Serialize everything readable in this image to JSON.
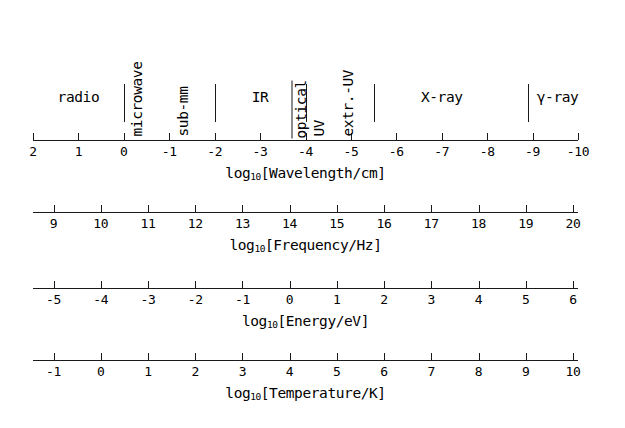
{
  "figure": {
    "background_color": "#ffffff",
    "ink_color": "#1a1a1a"
  },
  "chart_data": {
    "type": "table",
    "title": "",
    "axes": [
      {
        "name": "wavelength",
        "label": "log",
        "label_sub": "10",
        "label_rest": "[Wavelength/cm]",
        "label_full": "log10[Wavelength/cm]",
        "direction": "decreasing",
        "ticks": [
          "2",
          "1",
          "0",
          "-1",
          "-2",
          "-3",
          "-4",
          "-5",
          "-6",
          "-7",
          "-8",
          "-9",
          "-10"
        ],
        "tick_values": [
          2,
          1,
          0,
          -1,
          -2,
          -3,
          -4,
          -5,
          -6,
          -7,
          -8,
          -9,
          -10
        ],
        "range": [
          2,
          -10
        ],
        "tick_side": "up"
      },
      {
        "name": "frequency",
        "label": "log",
        "label_sub": "10",
        "label_rest": "[Frequency/Hz]",
        "label_full": "log10[Frequency/Hz]",
        "direction": "increasing",
        "ticks": [
          "9",
          "10",
          "11",
          "12",
          "13",
          "14",
          "15",
          "16",
          "17",
          "18",
          "19",
          "20"
        ],
        "tick_values": [
          9,
          10,
          11,
          12,
          13,
          14,
          15,
          16,
          17,
          18,
          19,
          20
        ],
        "range": [
          9,
          20
        ],
        "tick_side": "up"
      },
      {
        "name": "energy",
        "label": "log",
        "label_sub": "10",
        "label_rest": "[Energy/eV]",
        "label_full": "log10[Energy/eV]",
        "direction": "increasing",
        "ticks": [
          "-5",
          "-4",
          "-3",
          "-2",
          "-1",
          "0",
          "1",
          "2",
          "3",
          "4",
          "5",
          "6"
        ],
        "tick_values": [
          -5,
          -4,
          -3,
          -2,
          -1,
          0,
          1,
          2,
          3,
          4,
          5,
          6
        ],
        "range": [
          -5,
          6
        ],
        "tick_side": "up"
      },
      {
        "name": "temperature",
        "label": "log",
        "label_sub": "10",
        "label_rest": "[Temperature/K]",
        "label_full": "log10[Temperature/K]",
        "direction": "increasing",
        "ticks": [
          "-1",
          "0",
          "1",
          "2",
          "3",
          "4",
          "5",
          "6",
          "7",
          "8",
          "9",
          "10"
        ],
        "tick_values": [
          -1,
          0,
          1,
          2,
          3,
          4,
          5,
          6,
          7,
          8,
          9,
          10
        ],
        "range": [
          -1,
          10
        ],
        "tick_side": "up"
      }
    ],
    "bands": [
      {
        "name": "radio",
        "text": "radio",
        "orientation": "horizontal",
        "log_lambda_center": 1.0,
        "log_lambda_range": [
          2,
          0
        ]
      },
      {
        "name": "microwave",
        "text": "microwave",
        "orientation": "vertical",
        "log_lambda_center": -0.45,
        "log_lambda_range": [
          0,
          -2
        ]
      },
      {
        "name": "sub-mm",
        "text": "sub-mm",
        "orientation": "vertical",
        "log_lambda_center": -1.45,
        "log_lambda_range": [
          0,
          -2
        ]
      },
      {
        "name": "IR",
        "text": "IR",
        "orientation": "horizontal",
        "log_lambda_center": -3.0,
        "log_lambda_range": [
          -2,
          -4
        ]
      },
      {
        "name": "optical",
        "text": "optical",
        "orientation": "vertical",
        "log_lambda_center": -4.05,
        "log_lambda_range": [
          -4,
          -5
        ]
      },
      {
        "name": "UV",
        "text": "UV",
        "orientation": "vertical",
        "log_lambda_center": -4.45,
        "log_lambda_range": [
          -4,
          -5
        ]
      },
      {
        "name": "extreme-UV",
        "text": "extr.-UV",
        "orientation": "vertical",
        "log_lambda_center": -5.1,
        "log_lambda_range": [
          -5,
          -5.5
        ]
      },
      {
        "name": "X-ray",
        "text": "X-ray",
        "orientation": "horizontal",
        "log_lambda_center": -7.0,
        "log_lambda_range": [
          -5.5,
          -8.9
        ]
      },
      {
        "name": "gamma-ray",
        "text": "γ-ray",
        "orientation": "horizontal",
        "log_lambda_center": -9.55,
        "log_lambda_range": [
          -8.9,
          -10
        ]
      }
    ],
    "dividers_log_lambda": [
      0,
      -2,
      -4,
      -5.5,
      -8.9
    ],
    "xlabel": "",
    "ylabel": "",
    "grid": false,
    "legend": "none"
  }
}
